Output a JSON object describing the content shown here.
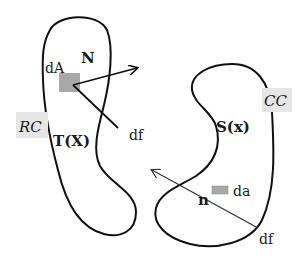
{
  "diagram": {
    "title": "",
    "reference_configuration": {
      "region_label": "RC",
      "normal_label": "N",
      "area_element_label": "dA",
      "force_label": "df",
      "traction_label": "T(X)"
    },
    "current_configuration": {
      "region_label": "CC",
      "normal_label": "n",
      "area_element_label": "da",
      "force_label": "df",
      "traction_label": "S(x)"
    },
    "colors": {
      "stroke": "#111111",
      "area_element_fill": "#a8a8a8",
      "label_box_fill": "#e6e6e6",
      "background": "#ffffff"
    }
  }
}
